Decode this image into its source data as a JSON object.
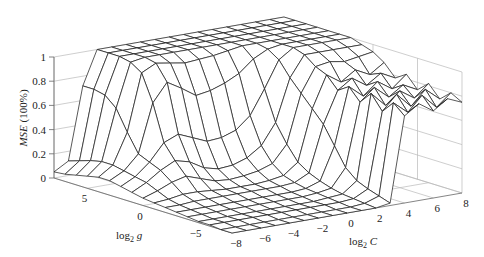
{
  "chart_data": {
    "type": "surface3d",
    "title": "",
    "xlabel": "log2 C",
    "ylabel": "log2 g",
    "zlabel": "MSE (100%)",
    "x_ticks": [
      -8,
      -6,
      -4,
      -2,
      0,
      2,
      4,
      6,
      8
    ],
    "y_ticks": [
      5,
      0,
      -5
    ],
    "z_ticks": [
      0,
      0.2,
      0.4,
      0.6,
      0.8,
      1
    ],
    "xlim": [
      -8,
      8
    ],
    "ylim": [
      -8,
      8
    ],
    "zlim": [
      0,
      1
    ],
    "grid": true,
    "x": [
      -8,
      -7,
      -6,
      -5,
      -4,
      -3,
      -2,
      -1,
      0,
      1,
      2,
      3,
      4,
      5,
      6,
      7,
      8
    ],
    "y": [
      -8,
      -7,
      -6,
      -5,
      -4,
      -3,
      -2,
      -1,
      0,
      1,
      2,
      3,
      4,
      5,
      6,
      7,
      8
    ],
    "z_description": "z[gi][ci]: MSE at log2 g = y[gi], log2 C = x[ci]",
    "z": [
      [
        0.0,
        0.0,
        0.0,
        0.0,
        0.0,
        0.0,
        0.0,
        0.0,
        0.0,
        0.0,
        0.0,
        0.02,
        0.72,
        0.8,
        0.72,
        0.8,
        0.75
      ],
      [
        0.0,
        0.0,
        0.0,
        0.0,
        0.0,
        0.0,
        0.0,
        0.0,
        0.0,
        0.0,
        0.01,
        0.05,
        0.8,
        0.7,
        0.82,
        0.7,
        0.8
      ],
      [
        0.01,
        0.01,
        0.01,
        0.01,
        0.01,
        0.01,
        0.01,
        0.01,
        0.01,
        0.01,
        0.02,
        0.08,
        0.7,
        0.82,
        0.7,
        0.82,
        0.72
      ],
      [
        0.01,
        0.01,
        0.01,
        0.01,
        0.01,
        0.01,
        0.01,
        0.01,
        0.01,
        0.02,
        0.03,
        0.12,
        0.82,
        0.7,
        0.8,
        0.72,
        0.82
      ],
      [
        0.02,
        0.02,
        0.02,
        0.02,
        0.02,
        0.02,
        0.02,
        0.02,
        0.02,
        0.03,
        0.05,
        0.2,
        0.72,
        0.82,
        0.72,
        0.8,
        0.74
      ],
      [
        0.03,
        0.03,
        0.03,
        0.03,
        0.03,
        0.03,
        0.03,
        0.03,
        0.03,
        0.04,
        0.08,
        0.35,
        0.82,
        0.72,
        0.82,
        0.74,
        0.84
      ],
      [
        0.04,
        0.04,
        0.05,
        0.05,
        0.05,
        0.05,
        0.05,
        0.05,
        0.05,
        0.06,
        0.12,
        0.5,
        0.76,
        0.84,
        0.76,
        0.84,
        0.78
      ],
      [
        0.05,
        0.06,
        0.08,
        0.08,
        0.07,
        0.06,
        0.06,
        0.06,
        0.07,
        0.09,
        0.18,
        0.6,
        0.86,
        0.78,
        0.86,
        0.8,
        0.88
      ],
      [
        0.06,
        0.1,
        0.15,
        0.18,
        0.14,
        0.1,
        0.09,
        0.1,
        0.12,
        0.16,
        0.3,
        0.7,
        0.9,
        0.92,
        0.9,
        0.92,
        0.94
      ],
      [
        0.08,
        0.14,
        0.22,
        0.28,
        0.25,
        0.18,
        0.15,
        0.16,
        0.2,
        0.28,
        0.45,
        0.8,
        0.97,
        0.97,
        0.97,
        0.97,
        0.97
      ],
      [
        0.1,
        0.16,
        0.26,
        0.4,
        0.45,
        0.4,
        0.35,
        0.36,
        0.4,
        0.5,
        0.7,
        0.92,
        1.0,
        1.0,
        1.0,
        1.0,
        1.0
      ],
      [
        0.12,
        0.18,
        0.3,
        0.7,
        0.85,
        0.78,
        0.7,
        0.72,
        0.76,
        0.82,
        0.92,
        0.98,
        1.0,
        1.0,
        1.0,
        1.0,
        1.0
      ],
      [
        0.12,
        0.2,
        0.45,
        0.92,
        0.98,
        0.96,
        0.94,
        0.95,
        0.96,
        0.98,
        1.0,
        1.0,
        1.0,
        1.0,
        1.0,
        1.0,
        1.0
      ],
      [
        0.1,
        0.2,
        0.62,
        0.98,
        1.0,
        1.0,
        1.0,
        1.0,
        1.0,
        1.0,
        1.0,
        1.0,
        1.0,
        1.0,
        1.0,
        1.0,
        1.0
      ],
      [
        0.08,
        0.18,
        0.7,
        1.0,
        1.0,
        1.0,
        1.0,
        1.0,
        1.0,
        1.0,
        1.0,
        1.0,
        1.0,
        1.0,
        1.0,
        1.0,
        1.0
      ],
      [
        0.06,
        0.15,
        0.72,
        1.0,
        1.0,
        1.0,
        1.0,
        1.0,
        1.0,
        1.0,
        1.0,
        1.0,
        1.0,
        1.0,
        1.0,
        1.0,
        1.0
      ],
      [
        0.05,
        0.12,
        0.72,
        1.0,
        1.0,
        1.0,
        1.0,
        1.0,
        1.0,
        1.0,
        1.0,
        1.0,
        1.0,
        1.0,
        1.0,
        1.0,
        1.0
      ]
    ]
  },
  "labels": {
    "zlabel_italic": "MSE",
    "zlabel_rest": " (100%)",
    "xlabel_prefix": "log",
    "xlabel_sub": "2",
    "xlabel_var": " C",
    "ylabel_prefix": "log",
    "ylabel_sub": "2",
    "ylabel_var": " g"
  },
  "projection": {
    "origin": [
      232,
      233
    ],
    "c_vector": [
      230,
      -40
    ],
    "g_vector": [
      -178,
      -55
    ],
    "z_scale": 121
  },
  "colors": {
    "surface_fill": "#ffffff",
    "mesh_line": "#222222",
    "grid_line": "#b9b9b9",
    "text": "#222222"
  }
}
